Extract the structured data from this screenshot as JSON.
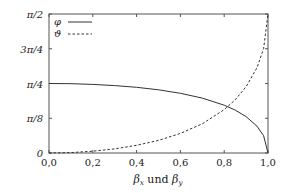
{
  "chart_data": {
    "type": "line",
    "title": "",
    "xlabel": "βx und βy",
    "xlabel_parts": {
      "beta": "β",
      "sub_x": "x",
      "und": " und ",
      "sub_y": "y"
    },
    "ylabel": "",
    "xlim": [
      0.0,
      1.0
    ],
    "ylim": [
      0,
      1.5708
    ],
    "x_ticks": [
      "0,0",
      "0,2",
      "0,4",
      "0,6",
      "0,8",
      "1,0"
    ],
    "y_ticks": [
      "0",
      "π/8",
      "π/4",
      "3π/4",
      "π/2"
    ],
    "grid": false,
    "legend_position": "upper left",
    "x": [
      0.0,
      0.1,
      0.2,
      0.3,
      0.4,
      0.5,
      0.6,
      0.7,
      0.8,
      0.85,
      0.9,
      0.95,
      0.98,
      1.0
    ],
    "series": [
      {
        "name": "φ",
        "style": "solid",
        "values": [
          0.785,
          0.783,
          0.775,
          0.762,
          0.742,
          0.714,
          0.675,
          0.62,
          0.54,
          0.485,
          0.411,
          0.303,
          0.195,
          0.0
        ]
      },
      {
        "name": "ϑ",
        "style": "dashed",
        "values": [
          0.0,
          0.005,
          0.02,
          0.046,
          0.087,
          0.142,
          0.221,
          0.33,
          0.491,
          0.601,
          0.749,
          0.964,
          1.18,
          1.571
        ]
      }
    ]
  },
  "legend": [
    {
      "label": "φ",
      "style": "solid"
    },
    {
      "label": "ϑ",
      "style": "dashed"
    }
  ],
  "colors": {
    "line": "#333333",
    "axis": "#555555"
  }
}
